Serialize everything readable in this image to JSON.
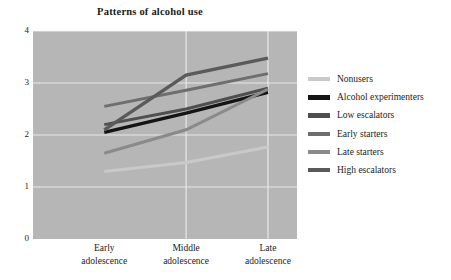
{
  "chart_data": {
    "type": "line",
    "title": "Patterns of alcohol use",
    "xlabel": "",
    "ylabel": "",
    "categories": [
      "Early\nadolescence",
      "Middle\nadolescence",
      "Late\nadolescence"
    ],
    "category_lines": [
      [
        "Early",
        "adolescence"
      ],
      [
        "Middle",
        "adolescence"
      ],
      [
        "Late",
        "adolescence"
      ]
    ],
    "ylim": [
      0,
      4
    ],
    "yticks": [
      "0",
      "1",
      "2",
      "3",
      "4"
    ],
    "grid": true,
    "legend_position": "right",
    "plot_background": "#b6b6b6",
    "gridline_color": "#e8e8e8",
    "series": [
      {
        "name": "Nonusers",
        "color": "#c9c9c9",
        "width": 3.0,
        "values": [
          1.3,
          1.47,
          1.77
        ]
      },
      {
        "name": "Alcohol experimenters",
        "color": "#141414",
        "width": 3.4,
        "values": [
          2.05,
          2.42,
          2.82
        ]
      },
      {
        "name": "Low escalators",
        "color": "#4f4f4f",
        "width": 3.0,
        "values": [
          2.2,
          2.5,
          2.9
        ]
      },
      {
        "name": "Early starters",
        "color": "#6e6e6e",
        "width": 3.0,
        "values": [
          2.55,
          2.86,
          3.18
        ]
      },
      {
        "name": "Late starters",
        "color": "#8a8a8a",
        "width": 3.0,
        "values": [
          1.65,
          2.1,
          2.88
        ]
      },
      {
        "name": "High escalators",
        "color": "#5a5a5a",
        "width": 3.4,
        "values": [
          2.1,
          3.15,
          3.48
        ]
      }
    ]
  }
}
